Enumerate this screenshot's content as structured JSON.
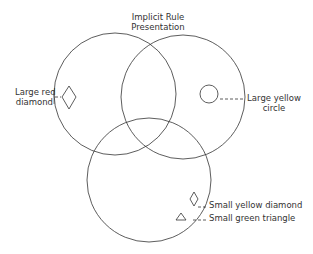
{
  "title": {
    "line1": "Implicit Rule",
    "line2": "Presentation"
  },
  "circles": [
    {
      "name": "top-left",
      "cx": 115,
      "cy": 94,
      "r": 61
    },
    {
      "name": "top-right",
      "cx": 183,
      "cy": 97,
      "r": 62
    },
    {
      "name": "bottom",
      "cx": 149,
      "cy": 180,
      "r": 62
    }
  ],
  "items": [
    {
      "shape": "diamond",
      "label_line1": "Large red",
      "label_line2": "diamond"
    },
    {
      "shape": "circle",
      "label_line1": "Large yellow",
      "label_line2": "circle"
    },
    {
      "shape": "diamond",
      "label": "Small yellow diamond"
    },
    {
      "shape": "triangle",
      "label": "Small green triangle"
    }
  ],
  "colors": {
    "stroke": "#333333",
    "text": "#333333"
  }
}
